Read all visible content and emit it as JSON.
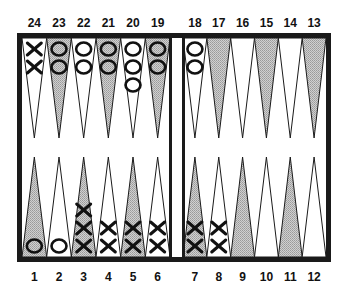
{
  "board": {
    "frame_color": "#1a1a1a",
    "shaded_color": "#bdbdbd",
    "light_color": "#ffffff",
    "top_labels": [
      "24",
      "23",
      "22",
      "21",
      "20",
      "19",
      "18",
      "17",
      "16",
      "15",
      "14",
      "13"
    ],
    "bottom_labels": [
      "1",
      "2",
      "3",
      "4",
      "5",
      "6",
      "7",
      "8",
      "9",
      "10",
      "11",
      "12"
    ],
    "points": [
      {
        "point": 1,
        "shaded": true,
        "checker": "O",
        "count": 1
      },
      {
        "point": 2,
        "shaded": false,
        "checker": "O",
        "count": 1
      },
      {
        "point": 3,
        "shaded": true,
        "checker": "X",
        "count": 3
      },
      {
        "point": 4,
        "shaded": false,
        "checker": "X",
        "count": 2
      },
      {
        "point": 5,
        "shaded": true,
        "checker": "X",
        "count": 2
      },
      {
        "point": 6,
        "shaded": false,
        "checker": "X",
        "count": 2
      },
      {
        "point": 7,
        "shaded": true,
        "checker": "X",
        "count": 2
      },
      {
        "point": 8,
        "shaded": false,
        "checker": "X",
        "count": 2
      },
      {
        "point": 9,
        "shaded": true,
        "checker": "",
        "count": 0
      },
      {
        "point": 10,
        "shaded": false,
        "checker": "",
        "count": 0
      },
      {
        "point": 11,
        "shaded": true,
        "checker": "",
        "count": 0
      },
      {
        "point": 12,
        "shaded": false,
        "checker": "",
        "count": 0
      },
      {
        "point": 13,
        "shaded": true,
        "checker": "",
        "count": 0
      },
      {
        "point": 14,
        "shaded": false,
        "checker": "",
        "count": 0
      },
      {
        "point": 15,
        "shaded": true,
        "checker": "",
        "count": 0
      },
      {
        "point": 16,
        "shaded": false,
        "checker": "",
        "count": 0
      },
      {
        "point": 17,
        "shaded": true,
        "checker": "",
        "count": 0
      },
      {
        "point": 18,
        "shaded": false,
        "checker": "O",
        "count": 2
      },
      {
        "point": 19,
        "shaded": true,
        "checker": "O",
        "count": 2
      },
      {
        "point": 20,
        "shaded": false,
        "checker": "O",
        "count": 3
      },
      {
        "point": 21,
        "shaded": true,
        "checker": "O",
        "count": 2
      },
      {
        "point": 22,
        "shaded": false,
        "checker": "O",
        "count": 2
      },
      {
        "point": 23,
        "shaded": true,
        "checker": "O",
        "count": 2
      },
      {
        "point": 24,
        "shaded": false,
        "checker": "X",
        "count": 2
      }
    ]
  }
}
